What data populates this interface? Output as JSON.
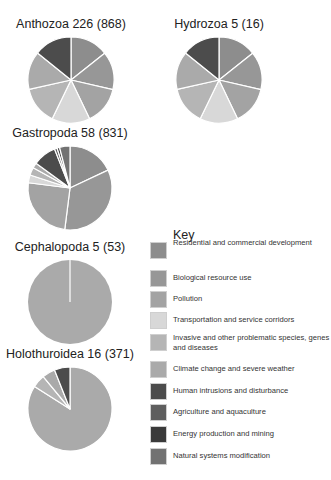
{
  "chart_data": {
    "type": "pie",
    "title": "",
    "legend": {
      "title": "Key",
      "position": "right",
      "entries": [
        {
          "label": "Residential and commercial development",
          "color": "#8d8d8d"
        },
        {
          "label": "Biological resource use",
          "color": "#979797"
        },
        {
          "label": "Pollution",
          "color": "#a3a3a3"
        },
        {
          "label": "Transportation and service corridors",
          "color": "#d8d8d8"
        },
        {
          "label": "Invasive and other problematic species, genes and diseases",
          "color": "#b5b5b5"
        },
        {
          "label": "Climate change and severe weather",
          "color": "#aaaaaa"
        },
        {
          "label": "Human intrusions and disturbance",
          "color": "#4c4c4c"
        },
        {
          "label": "Agriculture and aquaculture",
          "color": "#5e5e5e"
        },
        {
          "label": "Energy production and mining",
          "color": "#3a3a3a"
        },
        {
          "label": "Natural systems modification",
          "color": "#727272"
        }
      ]
    },
    "pies": [
      {
        "name": "Anthozoa",
        "species": 226,
        "records": 868,
        "title": "Anthozoa 226 (868)",
        "cx": 71,
        "cy": 80,
        "r": 43,
        "slices": [
          {
            "category": "Residential and commercial development",
            "value": 14.3
          },
          {
            "category": "Biological resource use",
            "value": 14.3
          },
          {
            "category": "Pollution",
            "value": 14.3
          },
          {
            "category": "Transportation and service corridors",
            "value": 14.3
          },
          {
            "category": "Invasive and other problematic species, genes and diseases",
            "value": 14.3
          },
          {
            "category": "Climate change and severe weather",
            "value": 14.3
          },
          {
            "category": "Human intrusions and disturbance",
            "value": 14.2
          }
        ]
      },
      {
        "name": "Hydrozoa",
        "species": 5,
        "records": 16,
        "title": "Hydrozoa 5 (16)",
        "cx": 219,
        "cy": 80,
        "r": 43,
        "slices": [
          {
            "category": "Residential and commercial development",
            "value": 14.3
          },
          {
            "category": "Biological resource use",
            "value": 14.3
          },
          {
            "category": "Pollution",
            "value": 14.3
          },
          {
            "category": "Transportation and service corridors",
            "value": 14.3
          },
          {
            "category": "Invasive and other problematic species, genes and diseases",
            "value": 14.3
          },
          {
            "category": "Climate change and severe weather",
            "value": 14.3
          },
          {
            "category": "Human intrusions and disturbance",
            "value": 14.2
          }
        ]
      },
      {
        "name": "Gastropoda",
        "species": 58,
        "records": 831,
        "title": "Gastropoda 58 (831)",
        "cx": 70,
        "cy": 188,
        "r": 42,
        "slices": [
          {
            "category": "Residential and commercial development",
            "value": 18
          },
          {
            "category": "Biological resource use",
            "value": 34
          },
          {
            "category": "Pollution",
            "value": 25
          },
          {
            "category": "Transportation and service corridors",
            "value": 3
          },
          {
            "category": "Invasive and other problematic species, genes and diseases",
            "value": 3
          },
          {
            "category": "Climate change and severe weather",
            "value": 2
          },
          {
            "category": "Human intrusions and disturbance",
            "value": 9
          },
          {
            "category": "Agriculture and aquaculture",
            "value": 1
          },
          {
            "category": "Energy production and mining",
            "value": 1
          },
          {
            "category": "Natural systems modification",
            "value": 4
          }
        ]
      },
      {
        "name": "Cephalopoda",
        "species": 5,
        "records": 53,
        "title": "Cephalopoda 5 (53)",
        "cx": 70,
        "cy": 302,
        "r": 42,
        "slices": [
          {
            "category": "Climate change and severe weather",
            "value": 100
          }
        ]
      },
      {
        "name": "Holothuroidea",
        "species": 16,
        "records": 371,
        "title": "Holothuroidea 16 (371)",
        "cx": 70,
        "cy": 409,
        "r": 42,
        "slices": [
          {
            "category": "Climate change and severe weather",
            "value": 84
          },
          {
            "category": "Invasive and other problematic species, genes and diseases",
            "value": 5
          },
          {
            "category": "Climate change and severe weather",
            "value": 5
          },
          {
            "category": "Human intrusions and disturbance",
            "value": 6
          }
        ]
      }
    ]
  }
}
